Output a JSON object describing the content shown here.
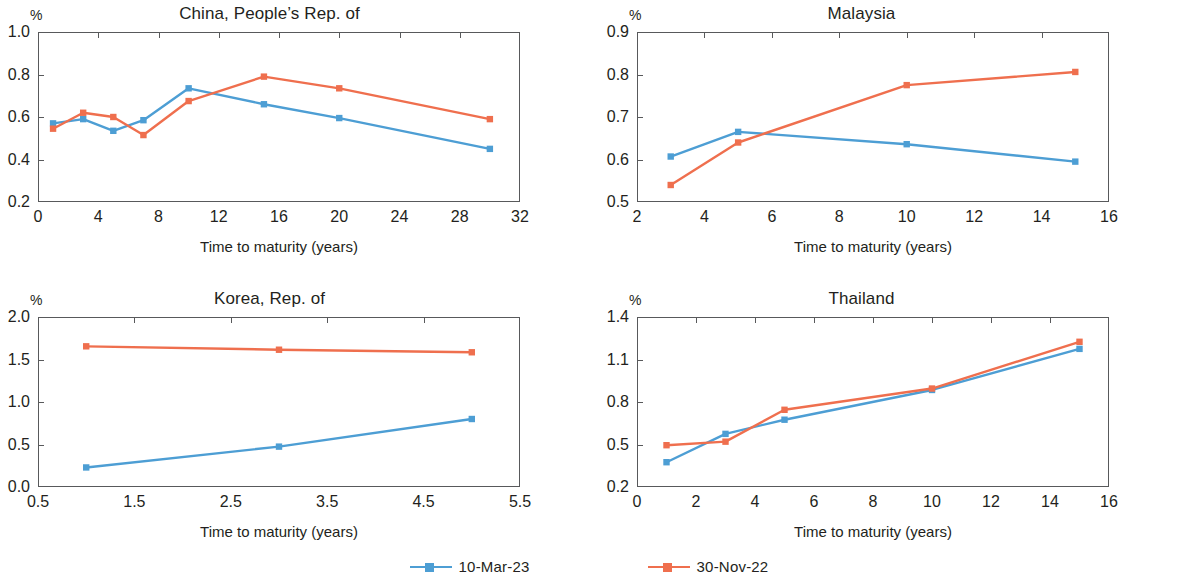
{
  "figure": {
    "unit_label": "%",
    "x_axis_title": "Time to maturity (years)",
    "series_colors": {
      "10-Mar-23": "#4d9ed4",
      "30-Nov-22": "#ef6f4e"
    }
  },
  "legend": {
    "position": "bottom-center",
    "items": [
      {
        "label": "10-Mar-23",
        "color": "#4d9ed4"
      },
      {
        "label": "30-Nov-22",
        "color": "#ef6f4e"
      }
    ]
  },
  "chart_data": [
    {
      "type": "line",
      "title": "China, People’s Rep. of",
      "xlabel": "Time to maturity (years)",
      "ylabel": "%",
      "xlim": [
        0,
        32
      ],
      "ylim": [
        0.2,
        1.0
      ],
      "xticks": [
        0,
        4,
        8,
        12,
        16,
        20,
        24,
        28,
        32
      ],
      "yticks": [
        0.2,
        0.4,
        0.6,
        0.8,
        1.0
      ],
      "xtick_labels": [
        "0",
        "4",
        "8",
        "12",
        "16",
        "20",
        "24",
        "28",
        "32"
      ],
      "ytick_labels": [
        "0.2",
        "0.4",
        "0.6",
        "0.8",
        "1.0"
      ],
      "grid": false,
      "series": [
        {
          "name": "10-Mar-23",
          "color": "#4d9ed4",
          "x": [
            1,
            3,
            5,
            7,
            10,
            15,
            20,
            30
          ],
          "values": [
            0.57,
            0.59,
            0.535,
            0.585,
            0.735,
            0.66,
            0.595,
            0.45
          ]
        },
        {
          "name": "30-Nov-22",
          "color": "#ef6f4e",
          "x": [
            1,
            3,
            5,
            7,
            10,
            15,
            20,
            30
          ],
          "values": [
            0.545,
            0.62,
            0.6,
            0.515,
            0.675,
            0.79,
            0.735,
            0.59
          ]
        }
      ]
    },
    {
      "type": "line",
      "title": "Malaysia",
      "xlabel": "Time to maturity (years)",
      "ylabel": "%",
      "xlim": [
        2,
        16
      ],
      "ylim": [
        0.5,
        0.9
      ],
      "xticks": [
        2,
        4,
        6,
        8,
        10,
        12,
        14,
        16
      ],
      "yticks": [
        0.5,
        0.6,
        0.7,
        0.8,
        0.9
      ],
      "xtick_labels": [
        "2",
        "4",
        "6",
        "8",
        "10",
        "12",
        "14",
        "16"
      ],
      "ytick_labels": [
        "0.5",
        "0.6",
        "0.7",
        "0.8",
        "0.9"
      ],
      "grid": false,
      "series": [
        {
          "name": "10-Mar-23",
          "color": "#4d9ed4",
          "x": [
            3,
            5,
            10,
            15
          ],
          "values": [
            0.607,
            0.665,
            0.636,
            0.595
          ]
        },
        {
          "name": "30-Nov-22",
          "color": "#ef6f4e",
          "x": [
            3,
            5,
            10,
            15
          ],
          "values": [
            0.54,
            0.64,
            0.775,
            0.806
          ]
        }
      ]
    },
    {
      "type": "line",
      "title": "Korea, Rep. of",
      "xlabel": "Time to maturity (years)",
      "ylabel": "%",
      "xlim": [
        0.5,
        5.5
      ],
      "ylim": [
        0.0,
        2.0
      ],
      "xticks": [
        0.5,
        1.5,
        2.5,
        3.5,
        4.5,
        5.5
      ],
      "yticks": [
        0.0,
        0.5,
        1.0,
        1.5,
        2.0
      ],
      "xtick_labels": [
        "0.5",
        "1.5",
        "2.5",
        "3.5",
        "4.5",
        "5.5"
      ],
      "ytick_labels": [
        "0.0",
        "0.5",
        "1.0",
        "1.5",
        "2.0"
      ],
      "grid": false,
      "series": [
        {
          "name": "10-Mar-23",
          "color": "#4d9ed4",
          "x": [
            1,
            3,
            5
          ],
          "values": [
            0.23,
            0.475,
            0.8
          ]
        },
        {
          "name": "30-Nov-22",
          "color": "#ef6f4e",
          "x": [
            1,
            3,
            5
          ],
          "values": [
            1.655,
            1.615,
            1.585
          ]
        }
      ]
    },
    {
      "type": "line",
      "title": "Thailand",
      "xlabel": "Time to maturity (years)",
      "ylabel": "%",
      "xlim": [
        0,
        16
      ],
      "ylim": [
        0.2,
        1.4
      ],
      "xticks": [
        0,
        2,
        4,
        6,
        8,
        10,
        12,
        14,
        16
      ],
      "yticks": [
        0.2,
        0.5,
        0.8,
        1.1,
        1.4
      ],
      "xtick_labels": [
        "0",
        "2",
        "4",
        "6",
        "8",
        "10",
        "12",
        "14",
        "16"
      ],
      "ytick_labels": [
        "0.2",
        "0.5",
        "0.8",
        "1.1",
        "1.4"
      ],
      "grid": false,
      "series": [
        {
          "name": "10-Mar-23",
          "color": "#4d9ed4",
          "x": [
            1,
            3,
            5,
            10,
            15
          ],
          "values": [
            0.375,
            0.575,
            0.675,
            0.885,
            1.175
          ]
        },
        {
          "name": "30-Nov-22",
          "color": "#ef6f4e",
          "x": [
            1,
            3,
            5,
            10,
            15
          ],
          "values": [
            0.495,
            0.52,
            0.745,
            0.895,
            1.225
          ]
        }
      ]
    }
  ]
}
